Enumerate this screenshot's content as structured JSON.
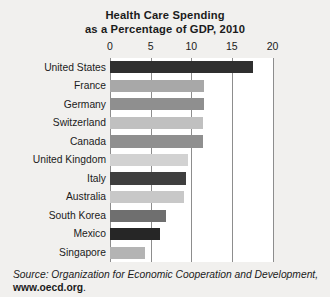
{
  "chart_data": {
    "type": "bar",
    "orientation": "horizontal",
    "title": "Health Care Spending as a Percentage of GDP, 2010",
    "title_lines": [
      "Health Care Spending",
      "as a Percentage of GDP, 2010"
    ],
    "xlabel": "",
    "ylabel": "",
    "xlim": [
      0,
      20
    ],
    "xticks": [
      0,
      5,
      10,
      15,
      20
    ],
    "xtick_labels": [
      "0",
      "5",
      "10",
      "15",
      "20"
    ],
    "grid": true,
    "legend": "none",
    "categories": [
      "United States",
      "France",
      "Germany",
      "Switzerland",
      "Canada",
      "United Kingdom",
      "Italy",
      "Australia",
      "South Korea",
      "Mexico",
      "Singapore"
    ],
    "values": [
      17.6,
      11.6,
      11.6,
      11.4,
      11.4,
      9.6,
      9.3,
      9.1,
      6.9,
      6.2,
      4.3
    ],
    "bar_colors": [
      "#2f2f2f",
      "#a8a8a8",
      "#8f8f8f",
      "#c0c0c0",
      "#8f8f8f",
      "#d2d2d2",
      "#3f3f3f",
      "#c8c8c8",
      "#6f6f6f",
      "#262626",
      "#b4b4b4"
    ]
  },
  "source": {
    "prefix": "Source:",
    "text": " Organization for Economic Cooperation and Development,",
    "url": "www.oecd.org",
    "period": "."
  },
  "colors": {
    "background": "#f1f0ee",
    "plot_background": "#ffffff",
    "gridline": "#8d8d8d",
    "text": "#1b1b1b"
  }
}
